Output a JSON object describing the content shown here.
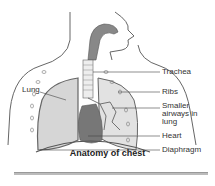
{
  "diagram": {
    "caption": "Anatomy of chest",
    "labels": {
      "trachea": "Trachea",
      "ribs": "Ribs",
      "smaller_airways": "Smaller airways in lung",
      "smaller_airways_l1": "Smaller",
      "smaller_airways_l2": "airways in",
      "smaller_airways_l3": "lung",
      "heart": "Heart",
      "diaphragm": "Diaphragm",
      "lung": "Lung"
    },
    "colors": {
      "outline": "#555555",
      "lung_fill": "#d6d6d6",
      "heart_fill": "#777777",
      "airway_fill": "#888888"
    }
  }
}
